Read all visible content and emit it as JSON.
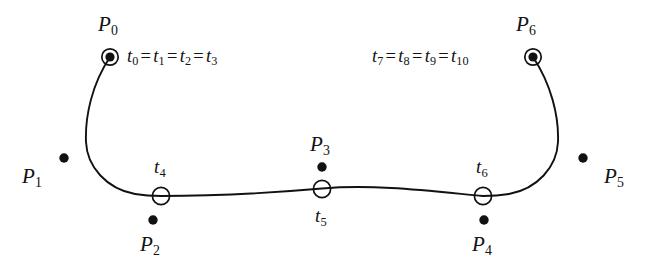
{
  "figure": {
    "background_color": "#ffffff",
    "stroke_color": "#111111",
    "control_points": [
      {
        "id": "P0",
        "base": "P",
        "sub": "0",
        "marker": "filled-dot-in-open-circle",
        "x": 110,
        "y": 57
      },
      {
        "id": "P1",
        "base": "P",
        "sub": "1",
        "marker": "filled-dot",
        "x": 64,
        "y": 158
      },
      {
        "id": "P2",
        "base": "P",
        "sub": "2",
        "marker": "filled-dot",
        "x": 153,
        "y": 220
      },
      {
        "id": "P3",
        "base": "P",
        "sub": "3",
        "marker": "filled-dot",
        "x": 322,
        "y": 167
      },
      {
        "id": "P4",
        "base": "P",
        "sub": "4",
        "marker": "filled-dot",
        "x": 484,
        "y": 220
      },
      {
        "id": "P5",
        "base": "P",
        "sub": "5",
        "marker": "filled-dot",
        "x": 583,
        "y": 158
      },
      {
        "id": "P6",
        "base": "P",
        "sub": "6",
        "marker": "filled-dot-in-open-circle",
        "x": 533,
        "y": 57
      }
    ],
    "knot_markers": [
      {
        "id": "t4",
        "base": "t",
        "sub": "4",
        "marker": "open-circle",
        "x": 161,
        "y": 196
      },
      {
        "id": "t5",
        "base": "t",
        "sub": "5",
        "marker": "open-circle",
        "x": 322,
        "y": 189
      },
      {
        "id": "t6",
        "base": "t",
        "sub": "6",
        "marker": "open-circle",
        "x": 483,
        "y": 196
      }
    ],
    "knot_equations": [
      {
        "id": "knots-start",
        "terms": [
          {
            "base": "t",
            "sub": "0"
          },
          {
            "base": "t",
            "sub": "1"
          },
          {
            "base": "t",
            "sub": "2"
          },
          {
            "base": "t",
            "sub": "3"
          }
        ],
        "operator": "=",
        "anchor_x": 127,
        "anchor_y": 47
      },
      {
        "id": "knots-end",
        "terms": [
          {
            "base": "t",
            "sub": "7"
          },
          {
            "base": "t",
            "sub": "8"
          },
          {
            "base": "t",
            "sub": "9"
          },
          {
            "base": "t",
            "sub": "10"
          }
        ],
        "operator": "=",
        "anchor_x": 372,
        "anchor_y": 47
      }
    ],
    "curve": {
      "stroke_width": 1.9,
      "path": "M 110 57 C 92 84 85 116 86 142 C 87 167 107 189 135 194 C 147 196 152 196 161 196 C 215 196 270 193 322 188.5 C 375 184 430 191 483 196 C 492 196 497 196 509 194 C 537 189 557 167 558 142 C 559 116 551 84 533 57"
    }
  },
  "text_labels": [
    {
      "id": "label-P0",
      "text": "P",
      "sub": "0",
      "x": 98,
      "y": 14,
      "cls": "p-label"
    },
    {
      "id": "label-P1",
      "text": "P",
      "sub": "1",
      "x": 22,
      "y": 166,
      "cls": "p-label"
    },
    {
      "id": "label-P2",
      "text": "P",
      "sub": "2",
      "x": 140,
      "y": 234,
      "cls": "p-label"
    },
    {
      "id": "label-P3",
      "text": "P",
      "sub": "3",
      "x": 310,
      "y": 134,
      "cls": "p-label"
    },
    {
      "id": "label-P4",
      "text": "P",
      "sub": "4",
      "x": 472,
      "y": 234,
      "cls": "p-label"
    },
    {
      "id": "label-P5",
      "text": "P",
      "sub": "5",
      "x": 604,
      "y": 166,
      "cls": "p-label"
    },
    {
      "id": "label-P6",
      "text": "P",
      "sub": "6",
      "x": 516,
      "y": 14,
      "cls": "p-label"
    },
    {
      "id": "label-t4",
      "text": "t",
      "sub": "4",
      "x": 154,
      "y": 157,
      "cls": "t-label"
    },
    {
      "id": "label-t5",
      "text": "t",
      "sub": "5",
      "x": 315,
      "y": 206,
      "cls": "t-label"
    },
    {
      "id": "label-t6",
      "text": "t",
      "sub": "6",
      "x": 476,
      "y": 157,
      "cls": "t-label"
    }
  ]
}
